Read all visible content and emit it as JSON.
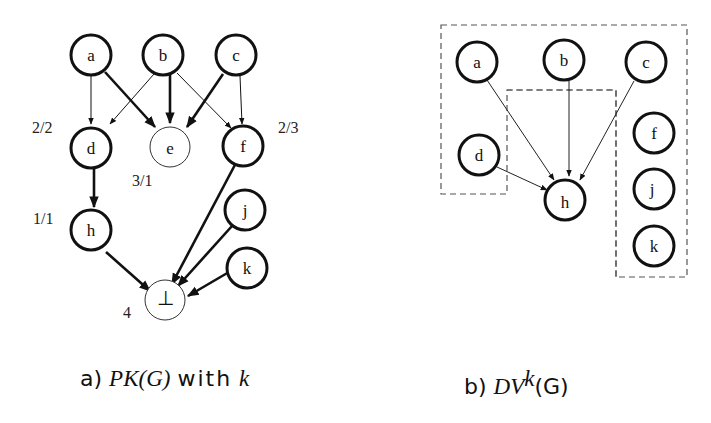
{
  "figure": {
    "panel_a": {
      "caption_prefix": "a)",
      "caption_math": "PK(G)",
      "caption_text": "with",
      "caption_var": "k",
      "nodes": [
        {
          "id": "a",
          "label": "a",
          "x": 91,
          "y": 55,
          "bold": true
        },
        {
          "id": "b",
          "label": "b",
          "x": 163,
          "y": 55,
          "bold": true
        },
        {
          "id": "c",
          "label": "c",
          "x": 236,
          "y": 55,
          "bold": true
        },
        {
          "id": "d",
          "label": "d",
          "x": 91,
          "y": 148,
          "bold": true
        },
        {
          "id": "e",
          "label": "e",
          "x": 170,
          "y": 147,
          "bold": false
        },
        {
          "id": "f",
          "label": "f",
          "x": 243,
          "y": 146,
          "bold": true
        },
        {
          "id": "h",
          "label": "h",
          "x": 91,
          "y": 230,
          "bold": true
        },
        {
          "id": "j",
          "label": "j",
          "x": 245,
          "y": 210,
          "bold": true
        },
        {
          "id": "k",
          "label": "k",
          "x": 247,
          "y": 268,
          "bold": true
        },
        {
          "id": "bot",
          "label": "⊥",
          "x": 165,
          "y": 300,
          "bold": false
        }
      ],
      "annotations": [
        {
          "text": "2/2",
          "x": 32,
          "y": 133
        },
        {
          "text": "2/3",
          "x": 278,
          "y": 133
        },
        {
          "text": "3/1",
          "x": 132,
          "y": 186
        },
        {
          "text": "1/1",
          "x": 33,
          "y": 224
        },
        {
          "text": "4",
          "x": 123,
          "y": 318
        }
      ]
    },
    "panel_b": {
      "caption_prefix": "b)",
      "caption_math": "DV",
      "caption_sup": "k",
      "caption_tail": "(G)",
      "nodes": [
        {
          "id": "a",
          "label": "a",
          "x": 477,
          "y": 62
        },
        {
          "id": "b",
          "label": "b",
          "x": 564,
          "y": 60
        },
        {
          "id": "c",
          "label": "c",
          "x": 646,
          "y": 62
        },
        {
          "id": "d",
          "label": "d",
          "x": 479,
          "y": 155
        },
        {
          "id": "h",
          "label": "h",
          "x": 565,
          "y": 200
        },
        {
          "id": "f",
          "label": "f",
          "x": 654,
          "y": 133
        },
        {
          "id": "j",
          "label": "j",
          "x": 654,
          "y": 189
        },
        {
          "id": "k",
          "label": "k",
          "x": 654,
          "y": 246
        }
      ]
    }
  }
}
